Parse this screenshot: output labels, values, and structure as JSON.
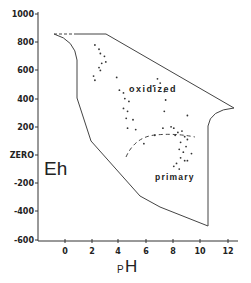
{
  "chart_data": {
    "type": "scatter",
    "title": "",
    "xlabel": "pH",
    "ylabel": "Eh",
    "xlim": [
      -2,
      13
    ],
    "ylim": [
      -600,
      1000
    ],
    "grid": false,
    "x_ticks": [
      "0",
      "2",
      "4",
      "6",
      "8",
      "10",
      "12"
    ],
    "x_tick_values": [
      0,
      2,
      4,
      6,
      8,
      10,
      12
    ],
    "y_ticks": [
      "1000",
      "800",
      "600",
      "400",
      "200",
      "ZERO",
      "-200",
      "-400",
      "-600"
    ],
    "y_tick_values": [
      1000,
      800,
      600,
      400,
      200,
      0,
      -200,
      -400,
      -600
    ],
    "annotations": [
      {
        "text": "oxidized",
        "x": 7.2,
        "y": 450
      },
      {
        "text": "primary",
        "x": 7.6,
        "y": -85
      }
    ],
    "boundary": {
      "description": "Natural environment Eh-pH limits",
      "points": [
        [
          -0.8,
          850
        ],
        [
          1.0,
          680
        ],
        [
          1.0,
          400
        ],
        [
          1.9,
          95
        ],
        [
          5.5,
          -290
        ],
        [
          7.0,
          -370
        ],
        [
          10.5,
          -500
        ],
        [
          10.5,
          210
        ],
        [
          12.5,
          330
        ],
        [
          3.0,
          850
        ],
        [
          -0.8,
          850
        ]
      ]
    },
    "divider": {
      "description": "dashed line separating oxidized and primary",
      "points": [
        [
          4.5,
          40
        ],
        [
          5.5,
          150
        ],
        [
          6.8,
          175
        ],
        [
          8.0,
          170
        ],
        [
          9.0,
          150
        ]
      ]
    },
    "series": [
      {
        "name": "samples",
        "points": [
          [
            2.2,
            780
          ],
          [
            2.5,
            750
          ],
          [
            2.6,
            720
          ],
          [
            2.9,
            700
          ],
          [
            2.7,
            650
          ],
          [
            3.0,
            660
          ],
          [
            2.5,
            620
          ],
          [
            2.6,
            600
          ],
          [
            2.1,
            560
          ],
          [
            2.2,
            530
          ],
          [
            3.8,
            550
          ],
          [
            4.0,
            460
          ],
          [
            4.3,
            440
          ],
          [
            4.4,
            400
          ],
          [
            4.7,
            380
          ],
          [
            4.3,
            330
          ],
          [
            4.6,
            310
          ],
          [
            4.5,
            260
          ],
          [
            5.0,
            250
          ],
          [
            5.2,
            180
          ],
          [
            4.6,
            190
          ],
          [
            6.8,
            540
          ],
          [
            7.0,
            510
          ],
          [
            6.5,
            490
          ],
          [
            7.3,
            450
          ],
          [
            7.4,
            390
          ],
          [
            7.3,
            310
          ],
          [
            5.8,
            80
          ],
          [
            6.6,
            140
          ],
          [
            7.2,
            190
          ],
          [
            7.8,
            200
          ],
          [
            8.0,
            190
          ],
          [
            8.3,
            160
          ],
          [
            8.1,
            140
          ],
          [
            8.6,
            170
          ],
          [
            8.8,
            130
          ],
          [
            9.0,
            110
          ],
          [
            8.5,
            90
          ],
          [
            8.9,
            60
          ],
          [
            8.4,
            40
          ],
          [
            8.7,
            20
          ],
          [
            8.5,
            -20
          ],
          [
            8.8,
            -40
          ],
          [
            8.2,
            -60
          ],
          [
            8.0,
            -80
          ],
          [
            8.4,
            -100
          ],
          [
            9.0,
            -40
          ],
          [
            9.3,
            10
          ],
          [
            9.0,
            280
          ]
        ]
      }
    ]
  },
  "axes": {
    "x_label": "pH",
    "y_label": "Eh",
    "x_ticks": [
      {
        "label": "0",
        "px": 65
      },
      {
        "label": "2",
        "px": 92
      },
      {
        "label": "4",
        "px": 118
      },
      {
        "label": "6",
        "px": 146
      },
      {
        "label": "8",
        "px": 173
      },
      {
        "label": "10",
        "px": 200
      },
      {
        "label": "12",
        "px": 228
      }
    ],
    "y_ticks": [
      {
        "label": "1000",
        "py": 14
      },
      {
        "label": "800",
        "py": 42
      },
      {
        "label": "600",
        "py": 70
      },
      {
        "label": "400",
        "py": 99
      },
      {
        "label": "200",
        "py": 127
      },
      {
        "label": "ZERO",
        "py": 155
      },
      {
        "label": "-200",
        "py": 183
      },
      {
        "label": "-400",
        "py": 211
      },
      {
        "label": "-600",
        "py": 240
      }
    ]
  },
  "labels": {
    "oxidized": "oxidized",
    "primary": "primary",
    "eh": "Eh",
    "ph_p": "P",
    "ph_h": "H"
  }
}
